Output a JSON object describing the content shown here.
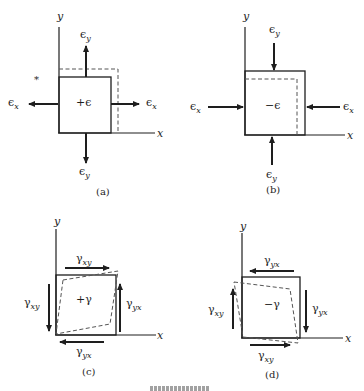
{
  "figure": {
    "panels": [
      {
        "id": "a",
        "caption": "(a)",
        "center_label": "+ϵ",
        "state": "tension",
        "axis_x": "x",
        "axis_y": "y",
        "arrow_labels": {
          "top": "ϵ",
          "top_sub": "y",
          "bottom": "ϵ",
          "bottom_sub": "y",
          "left": "ϵ",
          "left_sub": "x",
          "right": "ϵ",
          "right_sub": "x"
        },
        "stray_mark": "*"
      },
      {
        "id": "b",
        "caption": "(b)",
        "center_label": "−ϵ",
        "state": "compression",
        "axis_x": "x",
        "axis_y": "y",
        "arrow_labels": {
          "top": "ϵ",
          "top_sub": "y",
          "bottom": "ϵ",
          "bottom_sub": "y",
          "left": "ϵ",
          "left_sub": "x",
          "right": "ϵ",
          "right_sub": "x"
        }
      },
      {
        "id": "c",
        "caption": "(c)",
        "center_label": "+γ",
        "state": "positive shear",
        "axis_x": "x",
        "axis_y": "y",
        "arrow_labels": {
          "top": "γ",
          "top_sub": "xy",
          "left": "γ",
          "left_sub": "xy",
          "right": "γ",
          "right_sub": "yx",
          "bottom": "γ",
          "bottom_sub": "yx"
        }
      },
      {
        "id": "d",
        "caption": "(d)",
        "center_label": "−γ",
        "state": "negative shear",
        "axis_x": "x",
        "axis_y": "y",
        "arrow_labels": {
          "top": "γ",
          "top_sub": "yx",
          "left": "γ",
          "left_sub": "xy",
          "right": "γ",
          "right_sub": "yx",
          "bottom": "γ",
          "bottom_sub": "xy"
        }
      }
    ],
    "colors": {
      "ink": "#1e1e1e",
      "dash": "#555555",
      "background": "#ffffff"
    }
  }
}
